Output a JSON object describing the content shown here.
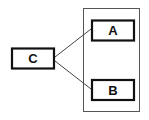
{
  "diagram": {
    "nodes": [
      {
        "id": "C",
        "label": "C"
      },
      {
        "id": "A",
        "label": "A"
      },
      {
        "id": "B",
        "label": "B"
      }
    ],
    "edges": [
      {
        "from": "C",
        "to": "A"
      },
      {
        "from": "C",
        "to": "B"
      }
    ],
    "groups": [
      {
        "contains": [
          "A",
          "B"
        ]
      }
    ],
    "colors": {
      "box_stroke": "#111111",
      "group_stroke": "#555555",
      "edge_stroke": "#444444"
    }
  }
}
